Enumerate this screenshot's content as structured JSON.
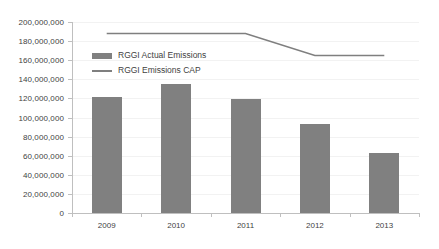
{
  "chart_data": {
    "type": "bar",
    "title": "",
    "subtitle": "",
    "xlabel": "",
    "ylabel": "",
    "categories": [
      "2009",
      "2010",
      "2011",
      "2012",
      "2013"
    ],
    "ylim": [
      0,
      200000000
    ],
    "ytick_step": 20000000,
    "ytick_labels": [
      "200,000,000",
      "180,000,000",
      "160,000,000",
      "140,000,000",
      "120,000,000",
      "100,000,000",
      "80,000,000",
      "60,000,000",
      "40,000,000",
      "20,000,000",
      "0"
    ],
    "ytick_values": [
      200000000,
      180000000,
      160000000,
      140000000,
      120000000,
      100000000,
      80000000,
      60000000,
      40000000,
      20000000,
      0
    ],
    "grid": true,
    "legend_position": "inside-upper-left",
    "series": [
      {
        "name": "RGGI Actual Emissions",
        "type": "bar",
        "color": "#808080",
        "values": [
          122000000,
          135000000,
          119000000,
          93000000,
          63000000
        ]
      },
      {
        "name": "RGGI Emissions CAP",
        "type": "line",
        "color": "#7f7f7f",
        "values": [
          188000000,
          188000000,
          188000000,
          165000000,
          165000000
        ]
      }
    ]
  },
  "legend": {
    "items": [
      {
        "label": "RGGI Actual Emissions",
        "swatch": "bar-swatch",
        "color": "#808080"
      },
      {
        "label": "RGGI Emissions CAP",
        "swatch": "line-swatch",
        "color": "#7f7f7f"
      }
    ]
  },
  "axis": {
    "y_labels": [
      "200,000,000",
      "180,000,000",
      "160,000,000",
      "140,000,000",
      "120,000,000",
      "100,000,000",
      "80,000,000",
      "60,000,000",
      "40,000,000",
      "20,000,000",
      "0"
    ],
    "x_labels": [
      "2009",
      "2010",
      "2011",
      "2012",
      "2013"
    ]
  },
  "colors": {
    "bar": "#808080",
    "line": "#7f7f7f",
    "grid": "#f2f2f2",
    "axis": "#bfbfbf",
    "text": "#3f3f3f",
    "background": "#ffffff"
  }
}
